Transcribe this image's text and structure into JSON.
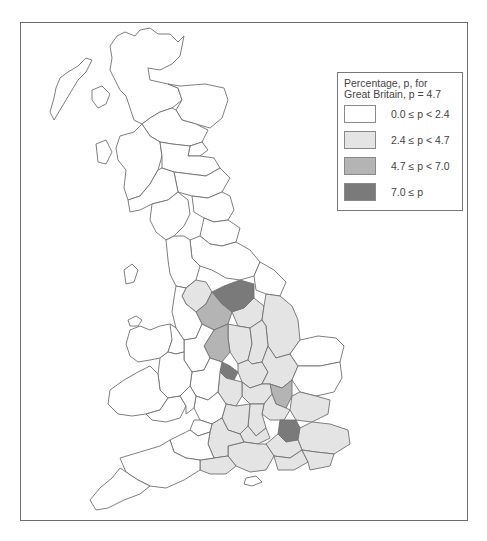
{
  "legend": {
    "title_line1": "Percentage, p, for",
    "title_line2": "Great Britain, p = 4.7",
    "classes": [
      {
        "label": "0.0 ≤ p < 2.4",
        "color": "#ffffff"
      },
      {
        "label": "2.4 ≤ p < 4.7",
        "color": "#e4e4e4"
      },
      {
        "label": "4.7 ≤ p < 7.0",
        "color": "#b4b4b4"
      },
      {
        "label": "7.0 ≤ p",
        "color": "#7a7a7a"
      }
    ]
  },
  "map": {
    "subject": "Great Britain choropleth by county",
    "national_value": 4.7,
    "outline_color": "#6f6f6f"
  }
}
